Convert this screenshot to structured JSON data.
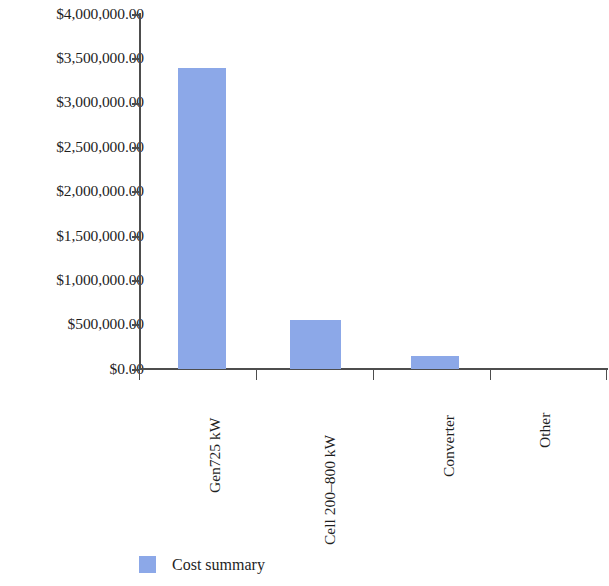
{
  "chart_data": {
    "type": "bar",
    "title": "",
    "xlabel": "",
    "ylabel": "",
    "categories": [
      "Gen725 kW",
      "Cell 200–800 kW",
      "Converter",
      "Other"
    ],
    "values": [
      3390000.0,
      552000.0,
      146000.0,
      0.0
    ],
    "series": [
      {
        "name": "Cost summary",
        "values": [
          3390000.0,
          552000.0,
          146000.0,
          0.0
        ],
        "color": "#8ca8e8"
      }
    ],
    "ylim": [
      0,
      4000000
    ],
    "ytick_values": [
      0,
      500000,
      1000000,
      1500000,
      2000000,
      2500000,
      3000000,
      3500000,
      4000000
    ],
    "ytick_labels": [
      "$0.00",
      "$500,000.00",
      "$1,000,000.00",
      "$1,500,000.00",
      "$2,000,000.00",
      "$2,500,000.00",
      "$3,000,000.00",
      "$3,500,000.00",
      "$4,000,000.00"
    ],
    "grid": false,
    "legend": {
      "position": "bottom",
      "entries": [
        {
          "label": "Cost summary",
          "color": "#8ca8e8"
        }
      ]
    },
    "axis_color": "#4d4d4d",
    "background": "#ffffff"
  }
}
